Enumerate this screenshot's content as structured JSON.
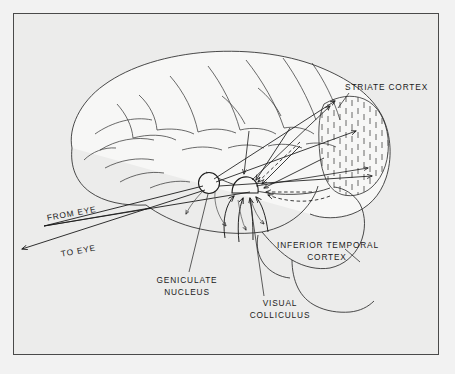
{
  "figure": {
    "type": "anatomical-diagram",
    "background_color": "#ececeb",
    "border_color": "#4a4a4a",
    "ink_color": "#1a1a1a"
  },
  "labels": {
    "striate_cortex": "STRIATE  CORTEX",
    "inferior_temporal_cortex_line1": "INFERIOR TEMPORAL",
    "inferior_temporal_cortex_line2": "CORTEX",
    "geniculate_nucleus_line1": "GENICULATE",
    "geniculate_nucleus_line2": "NUCLEUS",
    "visual_colliculus_line1": "VISUAL",
    "visual_colliculus_line2": "COLLICULUS",
    "from_eye": "FROM EYE",
    "to_eye": "TO EYE"
  }
}
